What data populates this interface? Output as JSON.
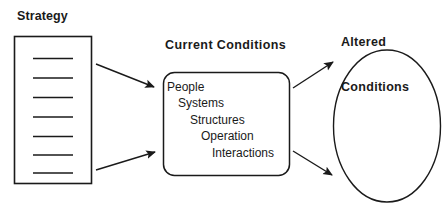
{
  "diagram": {
    "background_color": "#ffffff",
    "stroke_color": "#1a1a1a",
    "text_color": "#1a1a1a",
    "strategy": {
      "label": "Strategy",
      "shape": "rectangle",
      "line_count": 7
    },
    "current_conditions": {
      "label": "Current Conditions",
      "shape": "rounded-rectangle",
      "items": [
        "People",
        "Systems",
        "Structures",
        "Operation",
        "Interactions"
      ]
    },
    "altered_conditions": {
      "label_line_1": "Altered",
      "label_line_2": "Conditions",
      "shape": "ellipse"
    },
    "arrows": [
      {
        "name": "strategy-to-current-upper",
        "from": "strategy",
        "to": "current_conditions"
      },
      {
        "name": "strategy-to-current-lower",
        "from": "strategy",
        "to": "current_conditions"
      },
      {
        "name": "current-to-altered-upper",
        "from": "current_conditions",
        "to": "altered_conditions"
      },
      {
        "name": "current-to-altered-lower",
        "from": "current_conditions",
        "to": "altered_conditions"
      }
    ]
  }
}
